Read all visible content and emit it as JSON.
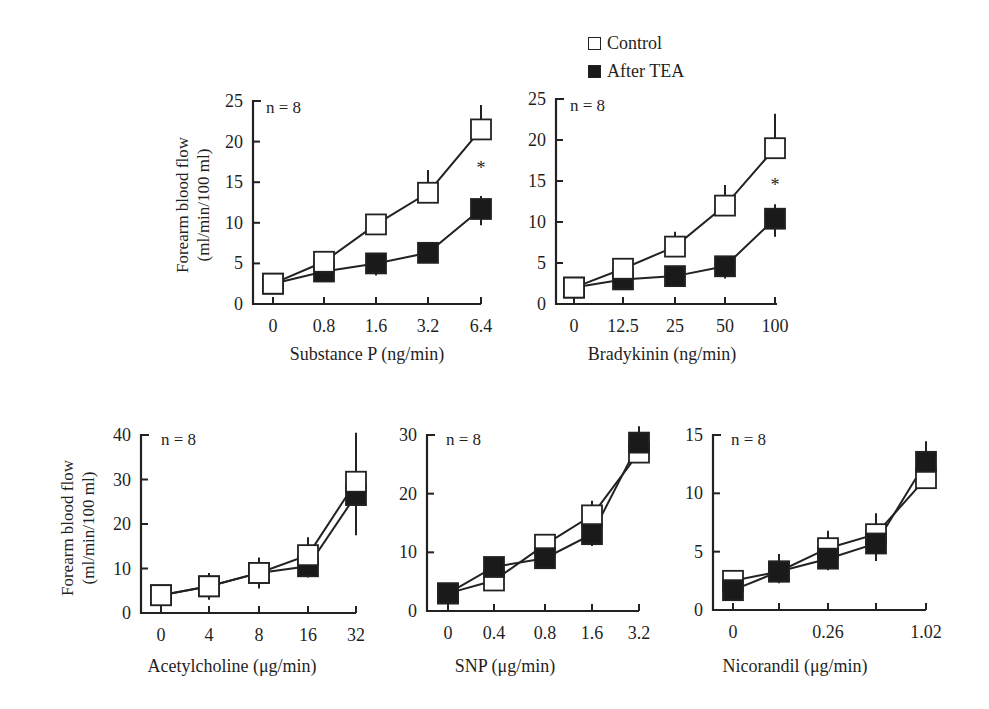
{
  "legend": {
    "items": [
      {
        "label": "Control",
        "marker": "open-square"
      },
      {
        "label": "After TEA",
        "marker": "filled-square"
      }
    ]
  },
  "shared_ylabel_line1": "Forearm blood flow",
  "shared_ylabel_line2": "(ml/min/100 ml)",
  "chart_data": [
    {
      "type": "line",
      "title": "",
      "annotation": "n = 8",
      "xlabel": "Substance P (ng/min)",
      "ylabel": "Forearm blood flow (ml/min/100 ml)",
      "categories": [
        "0",
        "0.8",
        "1.6",
        "3.2",
        "6.4"
      ],
      "ylim": [
        0,
        25
      ],
      "yticks": [
        0,
        5,
        10,
        15,
        20,
        25
      ],
      "series": [
        {
          "name": "Control",
          "values": [
            2.5,
            5.2,
            9.8,
            13.7,
            21.5
          ],
          "errors": [
            0.8,
            1.2,
            1.2,
            2.8,
            3.0
          ]
        },
        {
          "name": "After TEA",
          "values": [
            2.5,
            4.0,
            5.0,
            6.3,
            11.7
          ],
          "errors": [
            0.8,
            1.1,
            1.5,
            0.8,
            2.0
          ]
        }
      ],
      "significance": [
        {
          "x": "6.4",
          "label": "*"
        }
      ]
    },
    {
      "type": "line",
      "title": "",
      "annotation": "n = 8",
      "xlabel": "Bradykinin (ng/min)",
      "ylabel": "",
      "categories": [
        "0",
        "12.5",
        "25",
        "50",
        "100"
      ],
      "ylim": [
        0,
        25
      ],
      "yticks": [
        0,
        5,
        10,
        15,
        20,
        25
      ],
      "series": [
        {
          "name": "Control",
          "values": [
            2.0,
            4.3,
            7.0,
            12.0,
            19.0
          ],
          "errors": [
            0.7,
            1.2,
            1.8,
            2.5,
            4.2
          ]
        },
        {
          "name": "After TEA",
          "values": [
            2.0,
            3.0,
            3.4,
            4.6,
            10.4
          ],
          "errors": [
            0.7,
            1.0,
            1.0,
            1.5,
            2.2
          ]
        }
      ],
      "significance": [
        {
          "x": "100",
          "label": "*"
        }
      ]
    },
    {
      "type": "line",
      "title": "",
      "annotation": "n = 8",
      "xlabel": "Acetylcholine (μg/min)",
      "ylabel": "Forearm blood flow (ml/min/100 ml)",
      "categories": [
        "0",
        "4",
        "8",
        "16",
        "32"
      ],
      "ylim": [
        0,
        40
      ],
      "yticks": [
        0,
        10,
        20,
        30,
        40
      ],
      "series": [
        {
          "name": "Control",
          "values": [
            4.0,
            6.0,
            9.0,
            13.0,
            29.5
          ],
          "errors": [
            1.0,
            3.0,
            3.5,
            4.0,
            11.0
          ]
        },
        {
          "name": "After TEA",
          "values": [
            4.0,
            6.0,
            9.0,
            10.5,
            26.5
          ],
          "errors": [
            1.0,
            3.0,
            3.5,
            2.5,
            9.0
          ]
        }
      ],
      "significance": []
    },
    {
      "type": "line",
      "title": "",
      "annotation": "n = 8",
      "xlabel": "SNP (μg/min)",
      "ylabel": "",
      "categories": [
        "0",
        "0.4",
        "0.8",
        "1.6",
        "3.2"
      ],
      "ylim": [
        0,
        30
      ],
      "yticks": [
        0,
        10,
        20,
        30
      ],
      "series": [
        {
          "name": "Control",
          "values": [
            3.0,
            5.2,
            11.3,
            16.3,
            27.0
          ],
          "errors": [
            0.8,
            1.0,
            1.5,
            2.5,
            4.5
          ]
        },
        {
          "name": "After TEA",
          "values": [
            3.0,
            7.5,
            9.0,
            13.1,
            28.7
          ],
          "errors": [
            0.8,
            1.0,
            1.0,
            2.0,
            3.0
          ]
        }
      ],
      "significance": []
    },
    {
      "type": "line",
      "title": "",
      "annotation": "n = 8",
      "xlabel": "Nicorandil (μg/min)",
      "ylabel": "",
      "categories": [
        "0",
        "",
        "0.26",
        "",
        "1.02"
      ],
      "ylim": [
        0,
        15
      ],
      "yticks": [
        0,
        5,
        10,
        15
      ],
      "series": [
        {
          "name": "Control",
          "values": [
            2.5,
            3.3,
            5.3,
            6.5,
            11.3
          ],
          "errors": [
            0.5,
            1.5,
            1.5,
            1.8,
            2.3
          ]
        },
        {
          "name": "After TEA",
          "values": [
            1.7,
            3.3,
            4.4,
            5.7,
            12.7
          ],
          "errors": [
            0.5,
            1.0,
            1.0,
            1.5,
            2.2
          ]
        }
      ],
      "significance": []
    }
  ]
}
